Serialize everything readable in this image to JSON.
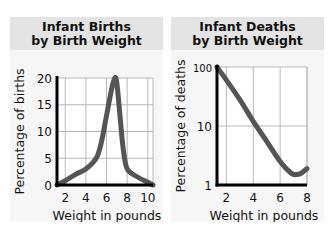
{
  "chart_data": [
    {
      "type": "line",
      "title": "Infant Births by Birth Weight",
      "title_lines": [
        "Infant Births",
        "by Birth Weight"
      ],
      "xlabel": "Weight in pounds",
      "ylabel": "Percentage of births",
      "x_ticks": [
        "2",
        "4",
        "6",
        "8",
        "10"
      ],
      "y_ticks": [
        "0",
        "5",
        "10",
        "15",
        "20"
      ],
      "xlim": [
        1.2,
        10.5
      ],
      "ylim": [
        0,
        20
      ],
      "y_scale": "linear",
      "grid": true,
      "legend": null,
      "series": [
        {
          "name": "Percentage of births",
          "x": [
            1.2,
            2,
            3,
            4,
            5,
            5.5,
            6,
            6.5,
            6.8,
            7,
            7.3,
            7.6,
            8,
            9,
            10,
            10.5
          ],
          "y": [
            0,
            0.8,
            2,
            3,
            5,
            8,
            13,
            18,
            20,
            19,
            13,
            7,
            3,
            1.5,
            0.5,
            0
          ]
        }
      ],
      "line_color": "#555555"
    },
    {
      "type": "line",
      "title": "Infant Deaths by Birth Weight",
      "title_lines": [
        "Infant Deaths",
        "by Birth Weight"
      ],
      "xlabel": "Weight in pounds",
      "ylabel": "Percentage of deaths",
      "x_ticks": [
        "2",
        "4",
        "6",
        "8"
      ],
      "y_ticks": [
        "1",
        "10",
        "100"
      ],
      "xlim": [
        1.3,
        8
      ],
      "ylim": [
        1,
        100
      ],
      "y_scale": "log",
      "grid": true,
      "legend": null,
      "series": [
        {
          "name": "Percentage of deaths",
          "x": [
            1.3,
            2,
            3,
            4,
            5,
            6,
            6.8,
            7.2,
            7.6,
            8
          ],
          "y": [
            100,
            60,
            28,
            12,
            5.5,
            2.5,
            1.6,
            1.5,
            1.6,
            1.9
          ]
        }
      ],
      "line_color": "#555555"
    }
  ]
}
